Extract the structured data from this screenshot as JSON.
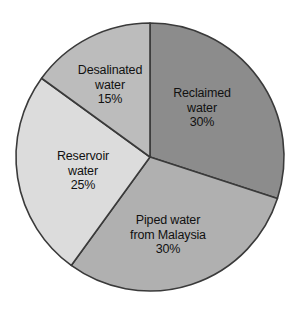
{
  "chart_data": {
    "type": "pie",
    "title": "",
    "subtitle": "",
    "xlabel": "",
    "ylabel": "",
    "legend": "none",
    "grid": false,
    "value_unit": "%",
    "total": 100,
    "start_angle_deg": 0,
    "direction": "clockwise",
    "categories": [
      "Reclaimed water",
      "Piped water from Malaysia",
      "Reservoir water",
      "Desalinated water"
    ],
    "values": [
      30,
      30,
      25,
      15
    ],
    "colors": [
      "#8c8c8c",
      "#b0b0b0",
      "#dcdcdc",
      "#bcbcbc"
    ],
    "slices": [
      {
        "name": "reclaimed-water",
        "label_lines": [
          "Reclaimed",
          "water"
        ],
        "value_text": "30%",
        "value": 30,
        "color": "#8c8c8c",
        "start_deg": 0,
        "end_deg": 108,
        "label_x": 202,
        "label_y": 108
      },
      {
        "name": "piped-water-from-malaysia",
        "label_lines": [
          "Piped water",
          "from Malaysia"
        ],
        "value_text": "30%",
        "value": 30,
        "color": "#b0b0b0",
        "start_deg": 108,
        "end_deg": 216,
        "label_x": 168,
        "label_y": 235
      },
      {
        "name": "reservoir-water",
        "label_lines": [
          "Reservoir",
          "water"
        ],
        "value_text": "25%",
        "value": 25,
        "color": "#dcdcdc",
        "start_deg": 216,
        "end_deg": 306,
        "label_x": 83,
        "label_y": 171
      },
      {
        "name": "desalinated-water",
        "label_lines": [
          "Desalinated",
          "water"
        ],
        "value_text": "15%",
        "value": 15,
        "color": "#bcbcbc",
        "start_deg": 306,
        "end_deg": 360,
        "label_x": 110,
        "label_y": 85
      }
    ],
    "geometry": {
      "center_x": 150,
      "center_y": 157,
      "radius": 134,
      "outline_color": "#3a3a3a",
      "background": "#ffffff"
    }
  }
}
